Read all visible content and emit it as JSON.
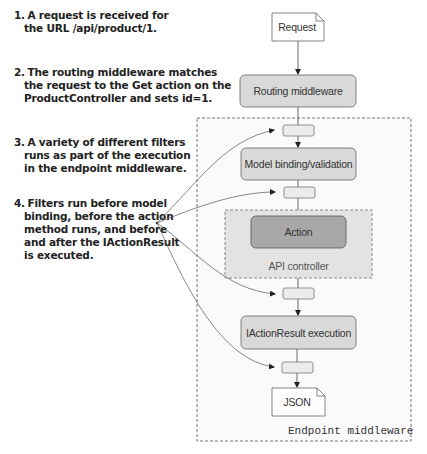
{
  "notes": [
    {
      "number": "1.",
      "lines": [
        "A request is received for",
        "the URL /api/product/1."
      ]
    },
    {
      "number": "2.",
      "lines": [
        "The routing middleware matches",
        "the request to the Get action on the",
        "ProductController and sets id=1."
      ]
    },
    {
      "number": "3.",
      "lines": [
        "A variety of different filters",
        "runs as part of the execution",
        "in the endpoint middleware."
      ]
    },
    {
      "number": "4.",
      "lines": [
        "Filters run before model",
        "binding, before the action",
        "method runs, and before",
        "and after the IActionResult",
        "is executed."
      ]
    }
  ],
  "diagram": {
    "request_doc": "Request",
    "routing_middleware": "Routing middleware",
    "model_binding": "Model binding/validation",
    "action": "Action",
    "api_controller": "API controller",
    "iactionresult": "IActionResult execution",
    "json_doc": "JSON",
    "endpoint_middleware": "Endpoint middleware"
  },
  "colors": {
    "box_fill": "#d9d9d9",
    "action_fill": "#a6a6a6",
    "controller_fill": "#e6e6e6",
    "filter_fill": "#ececec",
    "endpoint_fill": "#fafafa",
    "stroke": "#666666"
  }
}
